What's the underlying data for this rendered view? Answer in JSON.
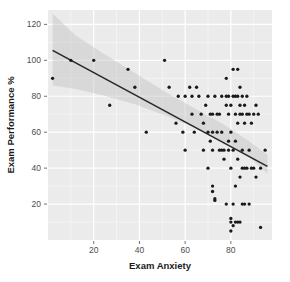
{
  "chart_data": {
    "type": "scatter",
    "title": "",
    "xlabel": "Exam Anxiety",
    "ylabel": "Exam Performance %",
    "xlim": [
      0,
      98
    ],
    "ylim": [
      0,
      128
    ],
    "xticks": [
      20,
      40,
      60,
      80
    ],
    "yticks": [
      20,
      40,
      60,
      80,
      100,
      120
    ],
    "grid": true,
    "legend": "none",
    "panel_background": "#ebebeb",
    "gridline_color": "#ffffff",
    "point_color": "#1a1a1a",
    "line_color": "#262626",
    "band_color": "#bfbfbf",
    "fit": {
      "type": "linear",
      "x_start": 2.0,
      "y_start": 105.5,
      "x_end": 96.0,
      "y_end": 41.0,
      "ci_band": true,
      "ci_upper": [
        [
          2.0,
          126.0
        ],
        [
          12.0,
          114.0
        ],
        [
          24.0,
          104.0
        ],
        [
          38.0,
          93.0
        ],
        [
          52.0,
          82.0
        ],
        [
          66.0,
          72.0
        ],
        [
          78.0,
          63.5
        ],
        [
          88.0,
          55.0
        ],
        [
          96.0,
          47.5
        ]
      ],
      "ci_lower": [
        [
          2.0,
          86.0
        ],
        [
          12.0,
          84.0
        ],
        [
          24.0,
          80.5
        ],
        [
          38.0,
          75.5
        ],
        [
          52.0,
          69.0
        ],
        [
          66.0,
          61.5
        ],
        [
          78.0,
          54.0
        ],
        [
          88.0,
          46.0
        ],
        [
          96.0,
          37.0
        ]
      ]
    },
    "points": [
      [
        2,
        90
      ],
      [
        10,
        100
      ],
      [
        20,
        100
      ],
      [
        27,
        75
      ],
      [
        35,
        95
      ],
      [
        38,
        85
      ],
      [
        43,
        60
      ],
      [
        51,
        100
      ],
      [
        53,
        85
      ],
      [
        56,
        65
      ],
      [
        57,
        80
      ],
      [
        59,
        60
      ],
      [
        60,
        80
      ],
      [
        60,
        50
      ],
      [
        62,
        85
      ],
      [
        63,
        70
      ],
      [
        63,
        80
      ],
      [
        64,
        60
      ],
      [
        65,
        85
      ],
      [
        66,
        80
      ],
      [
        67,
        70
      ],
      [
        68,
        50
      ],
      [
        68,
        65
      ],
      [
        69,
        75
      ],
      [
        70,
        80
      ],
      [
        70,
        60
      ],
      [
        70,
        40
      ],
      [
        71,
        70
      ],
      [
        71,
        55
      ],
      [
        72,
        70
      ],
      [
        72,
        60
      ],
      [
        72,
        30
      ],
      [
        72,
        27
      ],
      [
        72,
        50
      ],
      [
        73,
        80
      ],
      [
        73,
        22
      ],
      [
        73,
        23
      ],
      [
        74,
        70
      ],
      [
        74,
        60
      ],
      [
        75,
        50
      ],
      [
        75,
        70
      ],
      [
        76,
        50
      ],
      [
        76,
        60
      ],
      [
        76,
        80
      ],
      [
        77,
        50
      ],
      [
        77,
        45
      ],
      [
        78,
        90
      ],
      [
        78,
        75
      ],
      [
        78,
        80
      ],
      [
        78,
        20
      ],
      [
        79,
        50
      ],
      [
        79,
        55
      ],
      [
        79,
        70
      ],
      [
        79,
        80
      ],
      [
        80,
        60
      ],
      [
        80,
        75
      ],
      [
        80,
        40
      ],
      [
        80,
        12
      ],
      [
        80,
        5
      ],
      [
        80,
        10
      ],
      [
        81,
        80
      ],
      [
        81,
        95
      ],
      [
        81,
        50
      ],
      [
        81,
        20
      ],
      [
        81,
        8
      ],
      [
        82,
        80
      ],
      [
        82,
        70
      ],
      [
        82,
        55
      ],
      [
        82,
        30
      ],
      [
        82,
        10
      ],
      [
        83,
        95
      ],
      [
        83,
        80
      ],
      [
        83,
        65
      ],
      [
        83,
        45
      ],
      [
        83,
        10
      ],
      [
        84,
        85
      ],
      [
        84,
        75
      ],
      [
        84,
        70
      ],
      [
        84,
        35
      ],
      [
        84,
        10
      ],
      [
        85,
        80
      ],
      [
        85,
        70
      ],
      [
        85,
        50
      ],
      [
        85,
        20
      ],
      [
        85,
        40
      ],
      [
        86,
        75
      ],
      [
        86,
        65
      ],
      [
        86,
        40
      ],
      [
        86,
        20
      ],
      [
        87,
        80
      ],
      [
        87,
        70
      ],
      [
        87,
        40
      ],
      [
        88,
        70
      ],
      [
        88,
        50
      ],
      [
        88,
        20
      ],
      [
        89,
        65
      ],
      [
        89,
        40
      ],
      [
        90,
        70
      ],
      [
        90,
        40
      ],
      [
        91,
        75
      ],
      [
        91,
        35
      ],
      [
        92,
        70
      ],
      [
        93,
        40
      ],
      [
        93,
        7
      ],
      [
        95,
        50
      ]
    ]
  },
  "axes": {
    "x_tick_labels": [
      "20",
      "40",
      "60",
      "80"
    ],
    "y_tick_labels": [
      "20",
      "40",
      "60",
      "80",
      "100",
      "120"
    ],
    "x_title": "Exam Anxiety",
    "y_title": "Exam Performance %"
  }
}
